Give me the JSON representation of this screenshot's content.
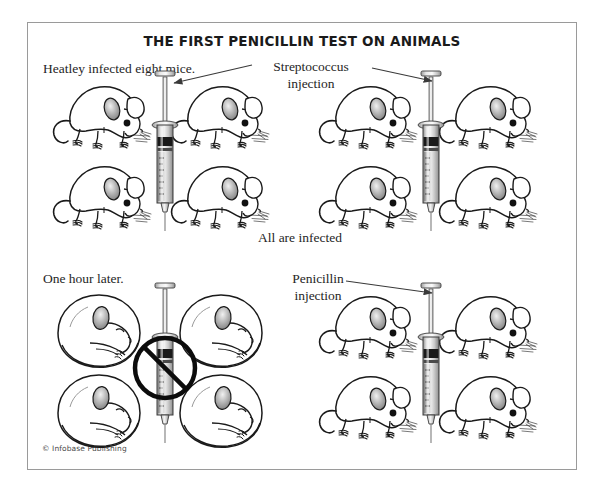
{
  "figure": {
    "title": "THE FIRST PENICILLIN TEST ON ANIMALS",
    "copyright": "© Infobase Publishing",
    "frame_color": "#9a9a9a",
    "ink_color": "#1a1a1a"
  },
  "captions": {
    "heatley": "Heatley infected eight mice.",
    "streptococcus_injection": "Streptococcus injection",
    "streptococcus_line1": "Streptococcus",
    "streptococcus_line2": "injection",
    "all_infected": "All are infected",
    "one_hour_later": "One hour later.",
    "penicillin_injection": "Penicillin injection",
    "penicillin_line1": "Penicillin",
    "penicillin_line2": "injection"
  },
  "panels": [
    {
      "id": "top-panel",
      "caption": "Heatley infected eight mice.",
      "label": "Streptococcus injection",
      "note": "All are infected",
      "mice_groups": [
        {
          "id": "top-left-group",
          "count": 4,
          "state": "alive-standing"
        },
        {
          "id": "top-right-group",
          "count": 4,
          "state": "alive-standing"
        }
      ],
      "syringes": [
        {
          "id": "syringe-top-left",
          "blocked": false
        },
        {
          "id": "syringe-top-right",
          "blocked": false
        }
      ],
      "arrows": [
        {
          "id": "arrow-strep-left",
          "direction": "left"
        },
        {
          "id": "arrow-strep-right",
          "direction": "right"
        }
      ]
    },
    {
      "id": "bottom-panel",
      "caption": "One hour later.",
      "label": "Penicillin injection",
      "mice_groups": [
        {
          "id": "bottom-left-group",
          "count": 4,
          "state": "dead-curled"
        },
        {
          "id": "bottom-right-group",
          "count": 4,
          "state": "alive-standing"
        }
      ],
      "syringes": [
        {
          "id": "syringe-bottom-left",
          "blocked": true
        },
        {
          "id": "syringe-bottom-right",
          "blocked": false
        }
      ],
      "arrows": [
        {
          "id": "arrow-pen-right",
          "direction": "right"
        }
      ]
    }
  ]
}
